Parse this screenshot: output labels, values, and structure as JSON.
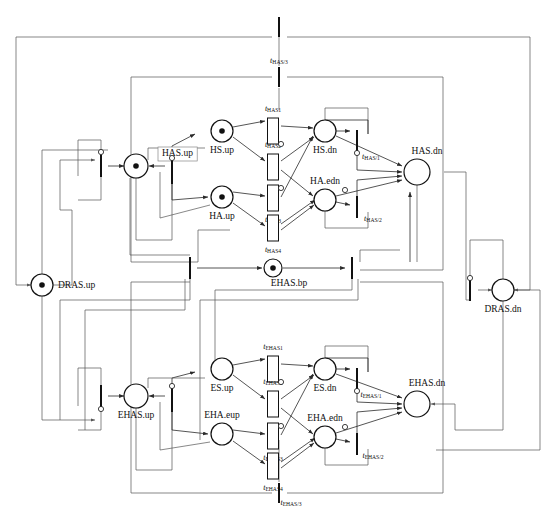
{
  "diagram": {
    "type": "petri-net",
    "width": 546,
    "height": 515,
    "colors": {
      "stroke": "#111111",
      "arc": "#2a2a2a",
      "arc_light": "#555555",
      "background": "#ffffff",
      "token": "#111111"
    }
  },
  "places": [
    {
      "id": "HAS.up",
      "label": "HAS.up",
      "x": 136,
      "y": 166,
      "r": 12,
      "tokens": 1,
      "label_pos": "boxed-top-right",
      "label_dx": 26,
      "label_dy": -12
    },
    {
      "id": "HS.up",
      "label": "HS.up",
      "x": 222,
      "y": 131,
      "r": 11,
      "tokens": 1,
      "label_pos": "bottom",
      "label_dx": 0,
      "label_dy": 20
    },
    {
      "id": "HA.up",
      "label": "HA.up",
      "x": 222,
      "y": 197,
      "r": 11,
      "tokens": 1,
      "label_pos": "bottom",
      "label_dx": 0,
      "label_dy": 20
    },
    {
      "id": "HS.dn",
      "label": "HS.dn",
      "x": 325,
      "y": 131,
      "r": 11,
      "tokens": 0,
      "label_pos": "bottom",
      "label_dx": 0,
      "label_dy": 20
    },
    {
      "id": "HA.edn",
      "label": "HA.edn",
      "x": 325,
      "y": 200,
      "r": 11,
      "tokens": 0,
      "label_pos": "top",
      "label_dx": 0,
      "label_dy": -18
    },
    {
      "id": "HAS.dn",
      "label": "HAS.dn",
      "x": 417,
      "y": 172,
      "r": 13,
      "tokens": 0,
      "label_pos": "top",
      "label_dx": 10,
      "label_dy": -20
    },
    {
      "id": "DRAS.up",
      "label": "DRAS.up",
      "x": 42,
      "y": 285,
      "r": 11,
      "tokens": 1,
      "label_pos": "right",
      "label_dx": 16,
      "label_dy": 1
    },
    {
      "id": "DRAS.dn",
      "label": "DRAS.dn",
      "x": 503,
      "y": 290,
      "r": 11,
      "tokens": 0,
      "label_pos": "bottom",
      "label_dx": 0,
      "label_dy": 20
    },
    {
      "id": "EHAS.bp",
      "label": "EHAS.bp",
      "x": 273,
      "y": 268,
      "r": 9,
      "tokens": 1,
      "label_pos": "bottom",
      "label_dx": 16,
      "label_dy": 16
    },
    {
      "id": "EHAS.up",
      "label": "EHAS.up",
      "x": 136,
      "y": 396,
      "r": 12,
      "tokens": 0,
      "label_pos": "bottom",
      "label_dx": 0,
      "label_dy": 20
    },
    {
      "id": "ES.up",
      "label": "ES.up",
      "x": 222,
      "y": 369,
      "r": 11,
      "tokens": 0,
      "label_pos": "bottom",
      "label_dx": 0,
      "label_dy": 20
    },
    {
      "id": "EHA.eup",
      "label": "EHA.eup",
      "x": 222,
      "y": 434,
      "r": 11,
      "tokens": 0,
      "label_pos": "top",
      "label_dx": 0,
      "label_dy": -18
    },
    {
      "id": "ES.dn",
      "label": "ES.dn",
      "x": 325,
      "y": 369,
      "r": 11,
      "tokens": 0,
      "label_pos": "bottom",
      "label_dx": 0,
      "label_dy": 20
    },
    {
      "id": "EHA.edn",
      "label": "EHA.edn",
      "x": 325,
      "y": 437,
      "r": 11,
      "tokens": 0,
      "label_pos": "top",
      "label_dx": 0,
      "label_dy": -18
    },
    {
      "id": "EHAS.dn",
      "label": "EHAS.dn",
      "x": 417,
      "y": 404,
      "r": 13,
      "tokens": 0,
      "label_pos": "top",
      "label_dx": 10,
      "label_dy": -20
    }
  ],
  "transitions": [
    {
      "id": "t_top",
      "label": "",
      "sub": "",
      "x": 279,
      "y": 27,
      "kind": "bar-h",
      "w": 2,
      "h": 20,
      "label_dx": 0,
      "label_dy": -12
    },
    {
      "id": "t_HAS3",
      "label": "t",
      "sub": "HAS/3",
      "x": 279,
      "y": 77,
      "kind": "bar-h",
      "w": 2,
      "h": 20,
      "label_dx": 0,
      "label_dy": -16
    },
    {
      "id": "t_HAS1",
      "label": "t",
      "sub": "HAS1",
      "x": 273,
      "y": 131,
      "kind": "box",
      "w": 11,
      "h": 26,
      "label_dx": 0,
      "label_dy": -22
    },
    {
      "id": "t_HAS2",
      "label": "t",
      "sub": "HAS2",
      "x": 273,
      "y": 167,
      "kind": "box",
      "w": 11,
      "h": 26,
      "label_dx": 0,
      "label_dy": -22
    },
    {
      "id": "t_HAS3b",
      "label": "t",
      "sub": "HAS3",
      "x": 273,
      "y": 198,
      "kind": "box",
      "w": 11,
      "h": 26,
      "label_dx": 0,
      "label_dy": 22
    },
    {
      "id": "t_HAS4",
      "label": "t",
      "sub": "HAS4",
      "x": 273,
      "y": 228,
      "kind": "box",
      "w": 11,
      "h": 26,
      "label_dx": 0,
      "label_dy": 22
    },
    {
      "id": "t_HASr1",
      "label": "t",
      "sub": "HAS/1",
      "x": 357,
      "y": 141,
      "kind": "bar-v",
      "w": 2,
      "h": 22,
      "label_dx": 14,
      "label_dy": 16
    },
    {
      "id": "t_HASr2",
      "label": "t",
      "sub": "HAS/2",
      "x": 357,
      "y": 207,
      "kind": "bar-v",
      "w": 2,
      "h": 22,
      "label_dx": 16,
      "label_dy": 12
    },
    {
      "id": "t_hasup_l",
      "label": "",
      "sub": "",
      "x": 101,
      "y": 166,
      "kind": "bar-v",
      "w": 2,
      "h": 22,
      "label_dx": 0,
      "label_dy": 0
    },
    {
      "id": "t_hasup_r",
      "label": "",
      "sub": "",
      "x": 172,
      "y": 172,
      "kind": "bar-v",
      "w": 2,
      "h": 24,
      "label_dx": 0,
      "label_dy": 0
    },
    {
      "id": "t_bp_l",
      "label": "",
      "sub": "",
      "x": 190,
      "y": 268,
      "kind": "bar-v",
      "w": 2,
      "h": 22,
      "label_dx": 0,
      "label_dy": 0
    },
    {
      "id": "t_bp_r",
      "label": "",
      "sub": "",
      "x": 352,
      "y": 268,
      "kind": "bar-v",
      "w": 2,
      "h": 22,
      "label_dx": 0,
      "label_dy": 0
    },
    {
      "id": "t_dras_dn",
      "label": "",
      "sub": "",
      "x": 470,
      "y": 290,
      "kind": "bar-v",
      "w": 2,
      "h": 22,
      "label_dx": 0,
      "label_dy": 0
    },
    {
      "id": "t_ehasup_l",
      "label": "",
      "sub": "",
      "x": 101,
      "y": 396,
      "kind": "bar-v",
      "w": 2,
      "h": 22,
      "label_dx": 0,
      "label_dy": 0
    },
    {
      "id": "t_ehasup_r",
      "label": "",
      "sub": "",
      "x": 172,
      "y": 400,
      "kind": "bar-v",
      "w": 2,
      "h": 24,
      "label_dx": 0,
      "label_dy": 0
    },
    {
      "id": "t_EHAS1",
      "label": "t",
      "sub": "EHAS1",
      "x": 273,
      "y": 369,
      "kind": "box",
      "w": 11,
      "h": 26,
      "label_dx": 0,
      "label_dy": -22
    },
    {
      "id": "t_EHAS2",
      "label": "t",
      "sub": "EHAS2",
      "x": 273,
      "y": 404,
      "kind": "box",
      "w": 11,
      "h": 26,
      "label_dx": 0,
      "label_dy": -22
    },
    {
      "id": "t_EHAS3",
      "label": "t",
      "sub": "EHAS3",
      "x": 273,
      "y": 436,
      "kind": "box",
      "w": 11,
      "h": 26,
      "label_dx": 0,
      "label_dy": 22
    },
    {
      "id": "t_EHAS4",
      "label": "t",
      "sub": "EHAS4",
      "x": 273,
      "y": 466,
      "kind": "box",
      "w": 11,
      "h": 26,
      "label_dx": 0,
      "label_dy": 22
    },
    {
      "id": "t_EHASr1",
      "label": "t",
      "sub": "EHAS/1",
      "x": 357,
      "y": 379,
      "kind": "bar-v",
      "w": 2,
      "h": 22,
      "label_dx": 14,
      "label_dy": 16
    },
    {
      "id": "t_EHASr2",
      "label": "t",
      "sub": "EHAS/2",
      "x": 357,
      "y": 444,
      "kind": "bar-v",
      "w": 2,
      "h": 22,
      "label_dx": 16,
      "label_dy": 12
    },
    {
      "id": "t_EHAS3bot",
      "label": "t",
      "sub": "EHAS/3",
      "x": 279,
      "y": 493,
      "kind": "bar-h",
      "w": 2,
      "h": 20,
      "label_dx": 12,
      "label_dy": 10
    }
  ],
  "legend": {
    "place_desc": "place (circle); filled dot = token",
    "transition_desc": "transition (bar or box)",
    "inhibitor_desc": "small open circle = inhibitor arc"
  }
}
